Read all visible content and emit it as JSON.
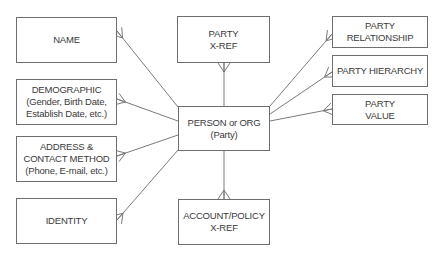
{
  "diagram": {
    "type": "entity-relationship",
    "colors": {
      "line": "#7a7a7a",
      "border": "#6e6e6e",
      "text": "#3a3a3a"
    },
    "entities": {
      "name": {
        "lines": [
          "NAME"
        ]
      },
      "demographic": {
        "lines": [
          "DEMOGRAPHIC",
          "(Gender, Birth Date,",
          "Establish Date, etc.)"
        ]
      },
      "address": {
        "lines": [
          "ADDRESS &",
          "CONTACT METHOD",
          "(Phone, E-mail, etc.)"
        ]
      },
      "identity": {
        "lines": [
          "IDENTITY"
        ]
      },
      "party_xref": {
        "lines": [
          "PARTY",
          "X-REF"
        ]
      },
      "party": {
        "lines": [
          "PERSON or ORG",
          "(Party)"
        ]
      },
      "account_xref": {
        "lines": [
          "ACCOUNT/POLICY",
          "X-REF"
        ]
      },
      "party_relationship": {
        "lines": [
          "PARTY",
          "RELATIONSHIP"
        ]
      },
      "party_hierarchy": {
        "lines": [
          "PARTY HIERARCHY"
        ]
      },
      "party_value": {
        "lines": [
          "PARTY",
          "VALUE"
        ]
      }
    },
    "relationships": [
      {
        "from": "party",
        "to": "name",
        "cardinality": "one-to-many"
      },
      {
        "from": "party",
        "to": "demographic",
        "cardinality": "one-to-many"
      },
      {
        "from": "party",
        "to": "address",
        "cardinality": "one-to-many"
      },
      {
        "from": "party",
        "to": "identity",
        "cardinality": "one-to-many"
      },
      {
        "from": "party",
        "to": "party_xref",
        "cardinality": "one-to-many"
      },
      {
        "from": "party",
        "to": "account_xref",
        "cardinality": "one-to-many"
      },
      {
        "from": "party",
        "to": "party_relationship",
        "cardinality": "one-to-many"
      },
      {
        "from": "party",
        "to": "party_hierarchy",
        "cardinality": "one-to-many"
      },
      {
        "from": "party",
        "to": "party_value",
        "cardinality": "one-to-many"
      }
    ]
  }
}
